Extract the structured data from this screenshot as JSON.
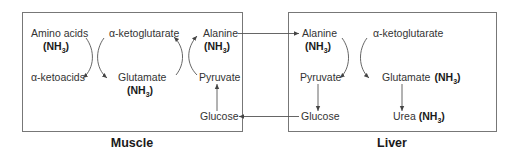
{
  "diagram": {
    "type": "glucose-alanine cycle",
    "muscle": {
      "title": "Muscle",
      "amino_acids": "Amino acids",
      "nh3_amino": "(NH",
      "alpha_ketoacids": "α-ketoacids",
      "alpha_ketoglutarate": "α-ketoglutarate",
      "glutamate": "Glutamate",
      "nh3_glutamate": "(NH",
      "alanine": "Alanine",
      "nh3_alanine": "(NH",
      "pyruvate": "Pyruvate",
      "glucose": "Glucose"
    },
    "liver": {
      "title": "Liver",
      "alanine": "Alanine",
      "nh3_alanine": "(NH",
      "alpha_ketoglutarate": "α-ketoglutarate",
      "pyruvate": "Pyruvate",
      "glutamate": "Glutamate",
      "nh3_glutamate": "(NH",
      "glucose": "Glucose",
      "urea": "Urea",
      "nh3_urea": "(NH"
    },
    "nh3_subscript": "3",
    "nh3_close": ")",
    "colors": {
      "box_border": "#777777",
      "text": "#333333",
      "arrow": "#555555"
    }
  }
}
